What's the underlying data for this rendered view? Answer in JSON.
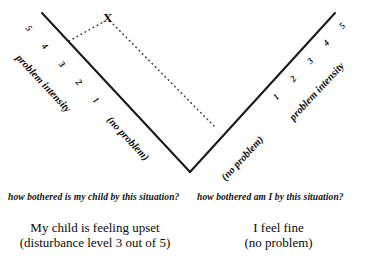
{
  "figure": {
    "title_marker": "X",
    "left_arm": {
      "axis_label": "problem intensity",
      "ticks": [
        "5",
        "4",
        "3",
        "2",
        "1"
      ],
      "zero_label": "(no problem)",
      "question": "how bothered is my child by this situation?",
      "summary_line1": "My child is feeling upset",
      "summary_line2": "(disturbance level 3 out of 5)"
    },
    "right_arm": {
      "axis_label": "problem intensity",
      "ticks": [
        "1",
        "2",
        "3",
        "4",
        "5"
      ],
      "zero_label": "(no problem)",
      "question": "how bothered am I by this situation?",
      "summary_line1": "I feel fine",
      "summary_line2": "(no problem)"
    },
    "colors": {
      "line": "#1a1a1a",
      "dotted": "#3a3a3a",
      "text": "#0d0d0d",
      "background": "#ffffff"
    }
  }
}
